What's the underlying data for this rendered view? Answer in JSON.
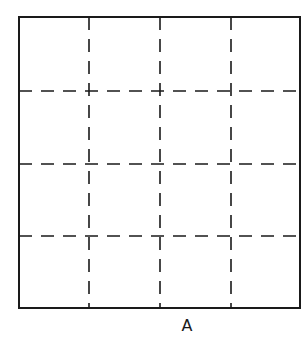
{
  "diagram": {
    "type": "grid-square",
    "rows": 4,
    "cols": 4,
    "outer_border": "solid",
    "inner_lines": "dashed",
    "label": "A",
    "stroke_color": "#1a1a1a"
  }
}
